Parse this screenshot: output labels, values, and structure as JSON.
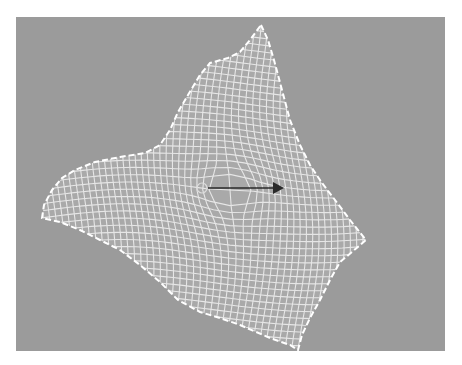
{
  "viewport": {
    "background": "#9b9b9b",
    "mesh_color": "#e6e6e6",
    "border_color": "#ffffff",
    "arrow_color": "#2a2a2a"
  },
  "mesh": {
    "outline_points": [
      [
        261,
        25
      ],
      [
        268,
        40
      ],
      [
        274,
        60
      ],
      [
        282,
        90
      ],
      [
        290,
        120
      ],
      [
        300,
        145
      ],
      [
        310,
        165
      ],
      [
        322,
        183
      ],
      [
        335,
        200
      ],
      [
        350,
        220
      ],
      [
        366,
        240
      ],
      [
        352,
        252
      ],
      [
        340,
        262
      ],
      [
        330,
        280
      ],
      [
        320,
        300
      ],
      [
        310,
        318
      ],
      [
        302,
        335
      ],
      [
        298,
        350
      ],
      [
        290,
        345
      ],
      [
        270,
        338
      ],
      [
        240,
        325
      ],
      [
        220,
        318
      ],
      [
        200,
        312
      ],
      [
        178,
        300
      ],
      [
        160,
        282
      ],
      [
        140,
        265
      ],
      [
        120,
        250
      ],
      [
        100,
        240
      ],
      [
        80,
        230
      ],
      [
        60,
        222
      ],
      [
        42,
        218
      ],
      [
        44,
        205
      ],
      [
        52,
        190
      ],
      [
        62,
        178
      ],
      [
        75,
        170
      ],
      [
        95,
        162
      ],
      [
        120,
        157
      ],
      [
        145,
        153
      ],
      [
        160,
        145
      ],
      [
        170,
        130
      ],
      [
        178,
        112
      ],
      [
        188,
        95
      ],
      [
        200,
        75
      ],
      [
        210,
        63
      ],
      [
        228,
        58
      ],
      [
        240,
        52
      ],
      [
        250,
        40
      ]
    ],
    "manipulator": {
      "origin": [
        202,
        188
      ],
      "tip": [
        284,
        188
      ]
    }
  }
}
